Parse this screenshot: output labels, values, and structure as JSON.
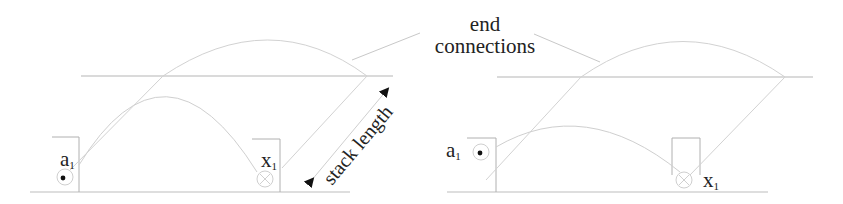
{
  "title": "",
  "labels": {
    "end_connections_line1": "end",
    "end_connections_line2": "connections",
    "stack_length": "stack length"
  },
  "left_panel": {
    "var_a": "a",
    "var_a_sub": "1",
    "var_a_symbol": "dot-circle (current out of page)",
    "var_x": "x",
    "var_x_sub": "1",
    "var_x_symbol": "cross-circle (current into page)"
  },
  "right_panel": {
    "var_a": "a",
    "var_a_sub": "1",
    "var_a_symbol": "dot-circle (current out of page)",
    "var_x": "x",
    "var_x_sub": "1",
    "var_x_symbol": "cross-circle (current into page)"
  },
  "colors": {
    "line": "#c8c8c8",
    "dark_line": "#a0a0a0",
    "text": "#222222",
    "arrow": "#111111"
  }
}
